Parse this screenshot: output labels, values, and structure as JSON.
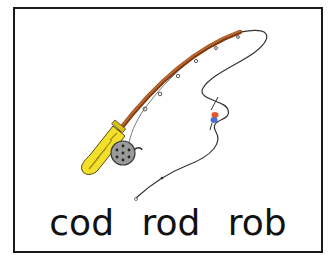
{
  "card": {
    "words": [
      "cod",
      "rod",
      "rob"
    ],
    "illustration": "fishing-rod"
  },
  "colors": {
    "border": "#1a1a1a",
    "rod": "#a0522d",
    "handle": "#f2e02a",
    "reel": "#8a8a8a",
    "bobber_top": "#e05a2a",
    "bobber_bottom": "#4a6fd0",
    "line": "#333333"
  }
}
